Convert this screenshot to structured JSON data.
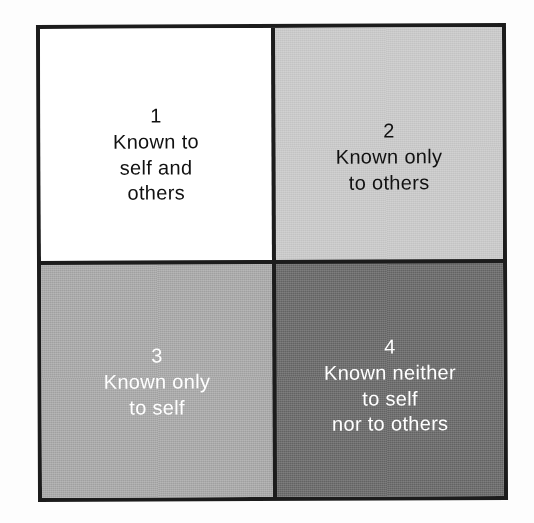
{
  "diagram": {
    "type": "johari-window",
    "frame": {
      "border_color": "#1c1c1c"
    },
    "quadrants": [
      {
        "id": "q1",
        "position": "top-left",
        "number": "1",
        "lines": [
          "Known to",
          "self and",
          "others"
        ],
        "background": "#ffffff",
        "text_color": "#111111"
      },
      {
        "id": "q2",
        "position": "top-right",
        "number": "2",
        "lines": [
          "Known only",
          "to others"
        ],
        "background": "#c9c9c9",
        "text_color": "#111111"
      },
      {
        "id": "q3",
        "position": "bottom-left",
        "number": "3",
        "lines": [
          "Known only",
          "to self"
        ],
        "background": "#a9a9a9",
        "text_color": "#ffffff"
      },
      {
        "id": "q4",
        "position": "bottom-right",
        "number": "4",
        "lines": [
          "Known neither",
          "to self",
          "nor to others"
        ],
        "background": "#6e6e6e",
        "text_color": "#ffffff"
      }
    ]
  }
}
